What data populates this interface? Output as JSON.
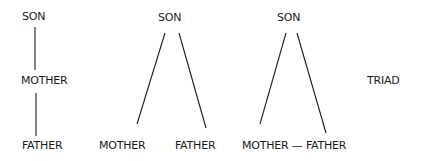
{
  "diagrams": [
    {
      "id": "chain",
      "labels": {
        "top": "SON",
        "middle": "MOTHER",
        "bottom": "FATHER"
      }
    },
    {
      "id": "fork",
      "labels": {
        "top": "SON",
        "left": "MOTHER",
        "right": "FATHER"
      }
    },
    {
      "id": "triangle",
      "labels": {
        "top": "SON",
        "bottom": "MOTHER — FATHER"
      }
    }
  ],
  "caption": "TRIAD"
}
